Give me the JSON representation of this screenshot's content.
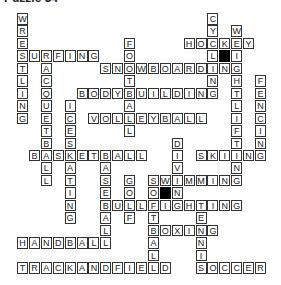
{
  "title": "Puzzle 34",
  "grid": {
    "origin_x": 17,
    "origin_y": 13,
    "cell_w": 11.9,
    "cell_h": 12.45,
    "black_cells": [
      [
        3,
        17
      ],
      [
        14,
        12
      ]
    ]
  },
  "words": [
    {
      "word": "WRESTLING",
      "dir": "down",
      "row": 0,
      "col": 0
    },
    {
      "word": "SURFING",
      "dir": "across",
      "row": 3,
      "col": 0
    },
    {
      "word": "RACQUETBALL",
      "dir": "down",
      "row": 3,
      "col": 2
    },
    {
      "word": "FOOTBALL",
      "dir": "down",
      "row": 2,
      "col": 9
    },
    {
      "word": "SNOWBOARDING",
      "dir": "across",
      "row": 4,
      "col": 7
    },
    {
      "word": "BODYBUILDING",
      "dir": "across",
      "row": 6,
      "col": 5
    },
    {
      "word": "CYCLING",
      "dir": "down",
      "row": 0,
      "col": 16
    },
    {
      "word": "HOCKEY",
      "dir": "across",
      "row": 2,
      "col": 14
    },
    {
      "word": "WEIGHTLIFTING",
      "dir": "down",
      "row": 1,
      "col": 18
    },
    {
      "word": "FENCING",
      "dir": "down",
      "row": 5,
      "col": 20
    },
    {
      "word": "VOLLEYBALL",
      "dir": "across",
      "row": 8,
      "col": 6
    },
    {
      "word": "ICESKATING",
      "dir": "down",
      "row": 7,
      "col": 4
    },
    {
      "word": "BASKETBALL",
      "dir": "across",
      "row": 11,
      "col": 1
    },
    {
      "word": "SKIING",
      "dir": "across",
      "row": 11,
      "col": 15
    },
    {
      "word": "DIVING",
      "dir": "down",
      "row": 10,
      "col": 13
    },
    {
      "word": "SWIMMING",
      "dir": "across",
      "row": 13,
      "col": 11
    },
    {
      "word": "BASEBALL",
      "dir": "down",
      "row": 11,
      "col": 7
    },
    {
      "word": "GOLF",
      "dir": "down",
      "row": 13,
      "col": 9
    },
    {
      "word": "SOFTBALL",
      "dir": "down",
      "row": 13,
      "col": 11
    },
    {
      "word": "BULLFIGHTING",
      "dir": "across",
      "row": 15,
      "col": 7
    },
    {
      "word": "TENNIS",
      "dir": "down",
      "row": 15,
      "col": 15
    },
    {
      "word": "BOXING",
      "dir": "across",
      "row": 17,
      "col": 11
    },
    {
      "word": "HANDBALL",
      "dir": "across",
      "row": 18,
      "col": 0
    },
    {
      "word": "TRACKANDFIELD",
      "dir": "across",
      "row": 20,
      "col": 0
    },
    {
      "word": "SOCCER",
      "dir": "across",
      "row": 20,
      "col": 15
    }
  ]
}
